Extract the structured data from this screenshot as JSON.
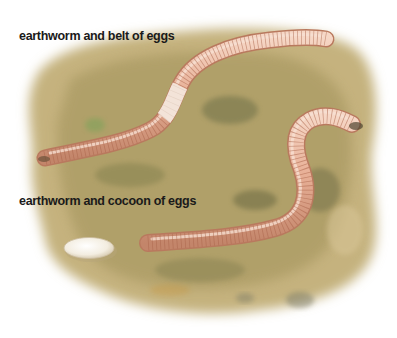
{
  "illustration": {
    "subject": "earthworm reproduction",
    "captions": {
      "top": "earthworm and belt of eggs",
      "bottom": "earthworm and cocoon of eggs"
    },
    "colors": {
      "background": "#ffffff",
      "soil_light": "#d9c48e",
      "soil_mid": "#b5a26a",
      "soil_dark": "#7f7a4e",
      "soil_moss": "#8e9a5c",
      "worm_body": "#e9b49a",
      "worm_shadow": "#c98a6e",
      "worm_highlight": "#f7dccd",
      "worm_segment": "#b9745a",
      "clitellum_belt": "#f2ded2",
      "cocoon": "#f6f1e6",
      "caption_text": "#1a1a1a"
    },
    "elements": [
      {
        "name": "soil-patch",
        "description": "irregular earth-toned ground area"
      },
      {
        "name": "upper-earthworm",
        "description": "long worm with pale egg belt (clitellum) near middle"
      },
      {
        "name": "lower-earthworm",
        "description": "S-curved worm emerging from burrow at right"
      },
      {
        "name": "egg-cocoon",
        "description": "pale oval cocoon of eggs at lower left"
      }
    ]
  }
}
